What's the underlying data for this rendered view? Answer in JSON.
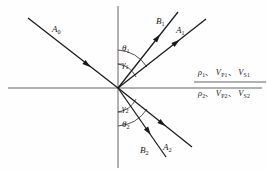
{
  "figure": {
    "background_color": "#fefefe",
    "line_color": "#1a1a1a",
    "axis_color": "#4a4a4a",
    "width": 267,
    "height": 172
  },
  "axes": {
    "interface_label": "horizontal-interface",
    "normal_label": "vertical-normal",
    "origin": {
      "x": 118,
      "y": 88
    }
  },
  "rays": [
    {
      "id": "A0",
      "label": "A",
      "subscript": "0",
      "role": "incident-ray",
      "label_x": 52,
      "label_y": 25,
      "x1": 28,
      "y1": 18,
      "x2": 118,
      "y2": 88,
      "arrow_at": 0.62,
      "arrow_direction": "toward-origin"
    },
    {
      "id": "B1",
      "label": "B",
      "subscript": "1",
      "role": "reflected-converted-ray",
      "label_x": 156,
      "label_y": 17,
      "x1": 118,
      "y1": 88,
      "x2": 178,
      "y2": 12,
      "arrow_at": 0.62,
      "arrow_direction": "away-from-origin"
    },
    {
      "id": "A1",
      "label": "A",
      "subscript": "1",
      "role": "reflected-ray",
      "label_x": 176,
      "label_y": 26,
      "x1": 118,
      "y1": 88,
      "x2": 206,
      "y2": 19,
      "arrow_at": 0.62,
      "arrow_direction": "away-from-origin"
    },
    {
      "id": "B2",
      "label": "B",
      "subscript": "2",
      "role": "transmitted-converted-ray",
      "label_x": 140,
      "label_y": 146,
      "x1": 118,
      "y1": 88,
      "x2": 166,
      "y2": 157,
      "arrow_at": 0.58,
      "arrow_direction": "away-from-origin"
    },
    {
      "id": "A2",
      "label": "A",
      "subscript": "2",
      "role": "transmitted-ray",
      "label_x": 163,
      "label_y": 143,
      "x1": 118,
      "y1": 88,
      "x2": 192,
      "y2": 147,
      "arrow_at": 0.55,
      "arrow_direction": "away-from-origin"
    }
  ],
  "angles": [
    {
      "id": "theta1",
      "symbol": "θ",
      "subscript": "1",
      "label_x": 122,
      "label_y": 47,
      "arc_radius": 38,
      "quadrant": "upper"
    },
    {
      "id": "gamma1",
      "symbol": "γ",
      "subscript": "1",
      "label_x": 122,
      "label_y": 62,
      "arc_radius": 24,
      "quadrant": "upper"
    },
    {
      "id": "gamma2",
      "symbol": "γ",
      "subscript": "2",
      "label_x": 122,
      "label_y": 106,
      "arc_radius": 24,
      "quadrant": "lower"
    },
    {
      "id": "theta2",
      "symbol": "θ",
      "subscript": "2",
      "label_x": 122,
      "label_y": 123,
      "arc_radius": 38,
      "quadrant": "lower"
    }
  ],
  "media": {
    "upper": {
      "id": "medium-1-properties",
      "density": "ρ",
      "density_sub": "1",
      "vp": "V",
      "vp_sub": "P1",
      "vs": "V",
      "vs_sub": "S1",
      "separator": "、",
      "x": 198,
      "y": 69
    },
    "lower": {
      "id": "medium-2-properties",
      "density": "ρ",
      "density_sub": "2",
      "vp": "V",
      "vp_sub": "P2",
      "vs": "V",
      "vs_sub": "S2",
      "separator": "、",
      "x": 198,
      "y": 90
    },
    "divider": {
      "x1": 194,
      "y1": 82,
      "x2": 266,
      "y2": 82
    }
  }
}
